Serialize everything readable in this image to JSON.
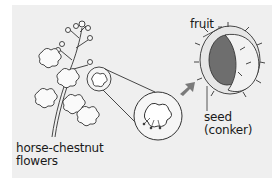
{
  "diagram": {
    "labels": {
      "flowers_line1": "horse-chestnut",
      "flowers_line2": "flowers",
      "fruit": "fruit",
      "seed_line1": "seed",
      "seed_line2": "(conker)"
    },
    "colors": {
      "background": "#efefef",
      "page": "#ffffff",
      "outline": "#333333",
      "arrow": "#7a7a7a",
      "husk": "#e6e6e6",
      "seed": "#6e6e6e"
    }
  }
}
